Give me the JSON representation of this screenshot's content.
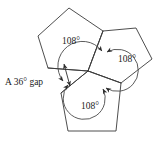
{
  "figure": {
    "background_color": "#ffffff",
    "stroke_color": "#3a3a3a",
    "text_color": "#1a1a1a",
    "center_point": {
      "x": 88,
      "y": 71
    },
    "angle_labels": [
      {
        "id": "top-left",
        "text": "108°",
        "x": 71,
        "y": 42
      },
      {
        "id": "right",
        "text": "108°",
        "x": 127,
        "y": 60
      },
      {
        "id": "bottom",
        "text": "108°",
        "x": 90,
        "y": 107
      }
    ],
    "gap_label": {
      "text": "A 36° gap",
      "x": 5,
      "y": 83
    },
    "pentagons": [
      {
        "id": "top-left-pentagon",
        "points": "88,71 48,68 38,36 69,8 103,31"
      },
      {
        "id": "right-pentagon",
        "points": "88,71 103,31 136,28 152,59 121,83"
      },
      {
        "id": "bottom-pentagon",
        "points": "88,71 121,83 116,131 68,131 61,93"
      }
    ],
    "arcs": [
      {
        "id": "arc-top-left",
        "d": "M 63,81 A 21,21 0 1 1 102,51"
      },
      {
        "id": "arc-right",
        "d": "M 107,52 A 21,21 0 1 1 106,88"
      },
      {
        "id": "arc-bottom",
        "d": "M 103,89 A 21,21 0 1 1 68,85"
      }
    ],
    "gap_arrow": {
      "id": "gap-double-arrow",
      "d": "M 64,64 L 70,86"
    }
  }
}
